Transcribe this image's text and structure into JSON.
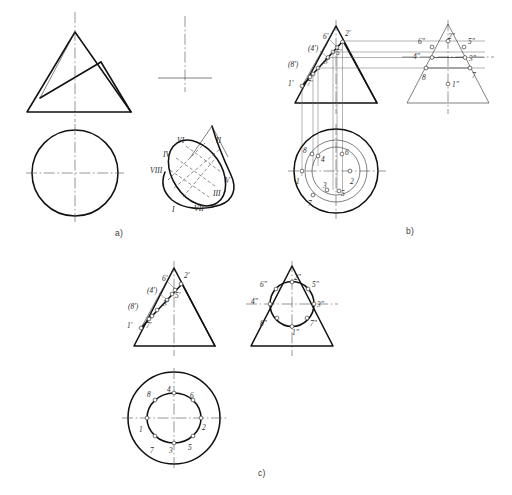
{
  "figure": {
    "panels": [
      {
        "id": "a",
        "caption": "a)",
        "description": "Given views: front view of cone with inclined cutting plane, top view circle, and pictorial view of the elliptical section",
        "pictorial_labels": [
          "VI",
          "II",
          "IV",
          "VIII",
          "V",
          "III",
          "I",
          "VII"
        ]
      },
      {
        "id": "b",
        "caption": "b)",
        "description": "Construction step: locating the eight section points by projection",
        "front_labels": [
          "6'",
          "2'",
          "(4')",
          "5'",
          "(8')",
          "3'",
          "1'",
          "7'"
        ],
        "side_labels": [
          "2\"",
          "6\"",
          "5\"",
          "4\"",
          "3\"",
          "8",
          "7",
          "1\""
        ],
        "top_labels": [
          "8",
          "4",
          "6",
          "1",
          "2",
          "3",
          "5",
          "7"
        ]
      },
      {
        "id": "c",
        "caption": "c)",
        "description": "Completed views: section curve drawn through the points",
        "front_labels": [
          "6'",
          "2'",
          "(4')",
          "5'",
          "(8')",
          "3'",
          "1'",
          "7'"
        ],
        "side_labels": [
          "2\"",
          "6\"",
          "5\"",
          "4\"",
          "3\"",
          "8\"",
          "7\"",
          "1\""
        ],
        "top_labels": [
          "8",
          "4",
          "6",
          "1",
          "2",
          "3",
          "5",
          "7"
        ]
      }
    ],
    "colors": {
      "outline": "#111111",
      "thin": "#333333",
      "axis": "#555555",
      "background": "#ffffff"
    }
  }
}
